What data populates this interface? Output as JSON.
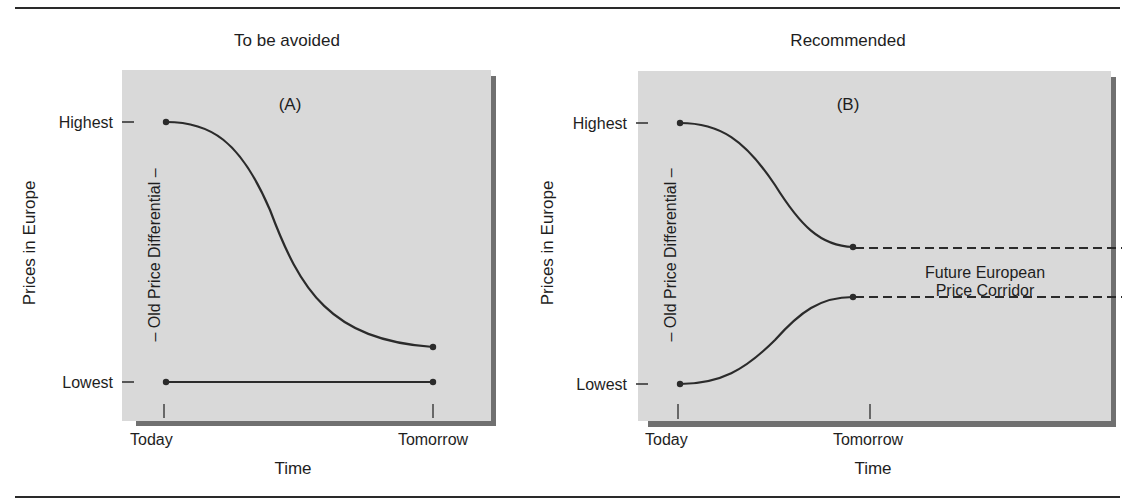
{
  "figure": {
    "rules": {
      "top_y": 8,
      "bottom_y": 497
    },
    "colors": {
      "panel_bg": "#d9d9d9",
      "panel_shadow": "#6e6e6e",
      "line": "#2b2b2b",
      "text": "#1e1e1e"
    }
  },
  "panel_a": {
    "title": "To be avoided",
    "label": "(A)",
    "y_axis_title": "Prices in Europe",
    "y_ticks": {
      "high": "Highest",
      "low": "Lowest"
    },
    "differential_label": "– Old Price Differential –",
    "x_ticks": {
      "start": "Today",
      "end": "Tomorrow"
    },
    "x_axis_title": "Time"
  },
  "panel_b": {
    "title": "Recommended",
    "label": "(B)",
    "y_axis_title": "Prices in Europe",
    "y_ticks": {
      "high": "Highest",
      "low": "Lowest"
    },
    "differential_label": "– Old Price Differential –",
    "x_ticks": {
      "start": "Today",
      "end": "Tomorrow"
    },
    "x_axis_title": "Time",
    "corridor_label_line1": "Future European",
    "corridor_label_line2": "Price Corridor"
  }
}
